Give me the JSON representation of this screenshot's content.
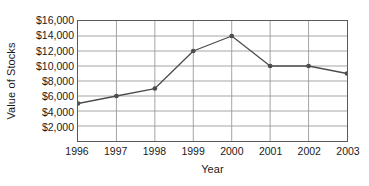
{
  "chart_data": {
    "type": "line",
    "title": "",
    "xlabel": "Year",
    "ylabel": "Value of Stocks",
    "categories": [
      "1996",
      "1997",
      "1998",
      "1999",
      "2000",
      "2001",
      "2002",
      "2003"
    ],
    "values": [
      5000,
      6000,
      7000,
      12000,
      14000,
      10000,
      10000,
      9000
    ],
    "series": [
      {
        "name": "Value of Stocks",
        "values": [
          5000,
          6000,
          7000,
          12000,
          14000,
          10000,
          10000,
          9000
        ]
      }
    ],
    "ylim": [
      0,
      16000
    ],
    "y_ticks": [
      2000,
      4000,
      6000,
      8000,
      10000,
      12000,
      14000,
      16000
    ],
    "y_tick_labels": [
      "$2,000",
      "$4,000",
      "$6,000",
      "$8,000",
      "$10,000",
      "$12,000",
      "$14,000",
      "$16,000"
    ],
    "grid": true,
    "legend": "none",
    "line_color": "#4d4d4d",
    "marker_color": "#4d4d4d",
    "grid_color": "#9a9a9a",
    "frame_color": "#5a5a5a",
    "background_color": "#ffffff"
  }
}
